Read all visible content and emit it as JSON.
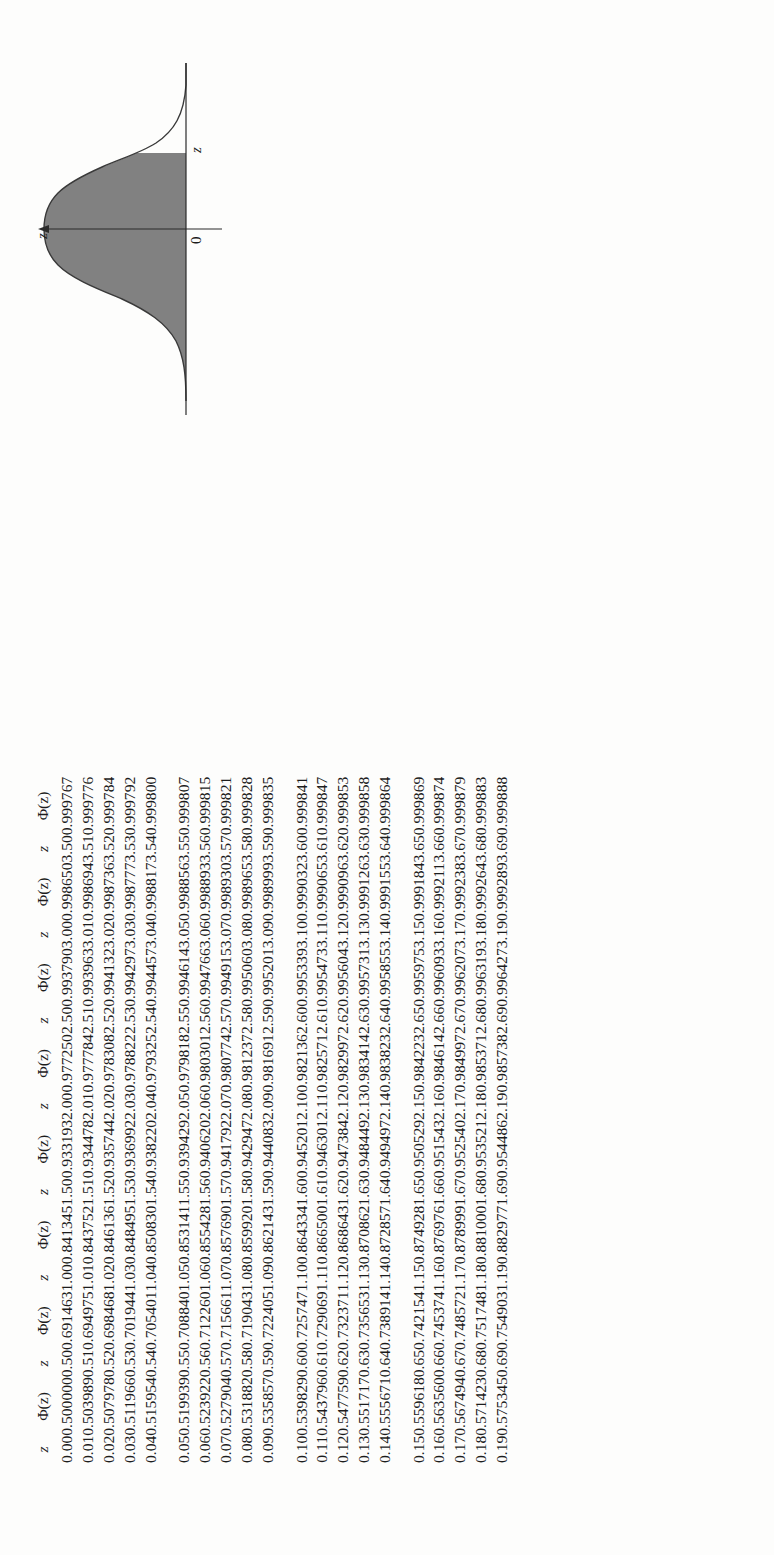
{
  "figure": {
    "name": "standard-normal-curve",
    "axis_label_top": "z",
    "origin_label": "0",
    "x_label": "z",
    "shade_color": "#7d7d7d",
    "curve_color": "#3a3a3a"
  },
  "table": {
    "headers": {
      "z": "z",
      "phi": "Φ(z)"
    },
    "group_count": 4,
    "rows_per_group": 5,
    "blocks": [
      {
        "start": "0.00",
        "z": [
          "0.00",
          "0.01",
          "0.02",
          "0.03",
          "0.04",
          "0.05",
          "0.06",
          "0.07",
          "0.08",
          "0.09",
          "0.10",
          "0.11",
          "0.12",
          "0.13",
          "0.14",
          "0.15",
          "0.16",
          "0.17",
          "0.18",
          "0.19"
        ],
        "phi": [
          "0.500000",
          "0.503989",
          "0.507978",
          "0.511966",
          "0.515954",
          "0.519939",
          "0.523922",
          "0.527904",
          "0.531882",
          "0.535857",
          "0.539829",
          "0.543796",
          "0.547759",
          "0.551717",
          "0.555671",
          "0.559618",
          "0.563560",
          "0.567494",
          "0.571423",
          "0.575345"
        ]
      },
      {
        "start": "0.50",
        "z": [
          "0.50",
          "0.51",
          "0.52",
          "0.53",
          "0.54",
          "0.55",
          "0.56",
          "0.57",
          "0.58",
          "0.59",
          "0.60",
          "0.61",
          "0.62",
          "0.63",
          "0.64",
          "0.65",
          "0.66",
          "0.67",
          "0.68",
          "0.69"
        ],
        "phi": [
          "0.691463",
          "0.694975",
          "0.698468",
          "0.701944",
          "0.705401",
          "0.708840",
          "0.712260",
          "0.715661",
          "0.719043",
          "0.722405",
          "0.725747",
          "0.729069",
          "0.732371",
          "0.735653",
          "0.738914",
          "0.742154",
          "0.745374",
          "0.748572",
          "0.751748",
          "0.754903"
        ]
      },
      {
        "start": "1.00",
        "z": [
          "1.00",
          "1.01",
          "1.02",
          "1.03",
          "1.04",
          "1.05",
          "1.06",
          "1.07",
          "1.08",
          "1.09",
          "1.10",
          "1.11",
          "1.12",
          "1.13",
          "1.14",
          "1.15",
          "1.16",
          "1.17",
          "1.18",
          "1.19"
        ],
        "phi": [
          "0.841345",
          "0.843752",
          "0.846136",
          "0.848495",
          "0.850830",
          "0.853141",
          "0.855428",
          "0.857690",
          "0.859920",
          "0.862143",
          "0.864334",
          "0.866500",
          "0.868643",
          "0.870862",
          "0.872857",
          "0.874928",
          "0.876976",
          "0.878999",
          "0.881000",
          "0.882977"
        ]
      },
      {
        "start": "1.50",
        "z": [
          "1.50",
          "1.51",
          "1.52",
          "1.53",
          "1.54",
          "1.55",
          "1.56",
          "1.57",
          "1.58",
          "1.59",
          "1.60",
          "1.61",
          "1.62",
          "1.63",
          "1.64",
          "1.65",
          "1.66",
          "1.67",
          "1.68",
          "1.69"
        ],
        "phi": [
          "0.933193",
          "0.934478",
          "0.935744",
          "0.936992",
          "0.938220",
          "0.939429",
          "0.940620",
          "0.941792",
          "0.942947",
          "0.944083",
          "0.945201",
          "0.946301",
          "0.947384",
          "0.948449",
          "0.949497",
          "0.950529",
          "0.951543",
          "0.952540",
          "0.953521",
          "0.954486"
        ]
      },
      {
        "start": "2.00",
        "z": [
          "2.00",
          "2.01",
          "2.02",
          "2.03",
          "2.04",
          "2.05",
          "2.06",
          "2.07",
          "2.08",
          "2.09",
          "2.10",
          "2.11",
          "2.12",
          "2.13",
          "2.14",
          "2.15",
          "2.16",
          "2.17",
          "2.18",
          "2.19"
        ],
        "phi": [
          "0.977250",
          "0.977784",
          "0.978308",
          "0.978822",
          "0.979325",
          "0.979818",
          "0.980301",
          "0.980774",
          "0.981237",
          "0.981691",
          "0.982136",
          "0.982571",
          "0.982997",
          "0.983414",
          "0.983823",
          "0.984223",
          "0.984614",
          "0.984997",
          "0.985371",
          "0.985738"
        ]
      },
      {
        "start": "2.50",
        "z": [
          "2.50",
          "2.51",
          "2.52",
          "2.53",
          "2.54",
          "2.55",
          "2.56",
          "2.57",
          "2.58",
          "2.59",
          "2.60",
          "2.61",
          "2.62",
          "2.63",
          "2.64",
          "2.65",
          "2.66",
          "2.67",
          "2.68",
          "2.69"
        ],
        "phi": [
          "0.993790",
          "0.993963",
          "0.994132",
          "0.994297",
          "0.994457",
          "0.994614",
          "0.994766",
          "0.994915",
          "0.995060",
          "0.995201",
          "0.995339",
          "0.995473",
          "0.995604",
          "0.995731",
          "0.995855",
          "0.995975",
          "0.996093",
          "0.996207",
          "0.996319",
          "0.996427"
        ]
      },
      {
        "start": "3.00",
        "z": [
          "3.00",
          "3.01",
          "3.02",
          "3.03",
          "3.04",
          "3.05",
          "3.06",
          "3.07",
          "3.08",
          "3.09",
          "3.10",
          "3.11",
          "3.12",
          "3.13",
          "3.14",
          "3.15",
          "3.16",
          "3.17",
          "3.18",
          "3.19"
        ],
        "phi": [
          "0.998650",
          "0.998694",
          "0.998736",
          "0.998777",
          "0.998817",
          "0.998856",
          "0.998893",
          "0.998930",
          "0.998965",
          "0.998999",
          "0.999032",
          "0.999065",
          "0.999096",
          "0.999126",
          "0.999155",
          "0.999184",
          "0.999211",
          "0.999238",
          "0.999264",
          "0.999289"
        ]
      },
      {
        "start": "3.50",
        "z": [
          "3.50",
          "3.51",
          "3.52",
          "3.53",
          "3.54",
          "3.55",
          "3.56",
          "3.57",
          "3.58",
          "3.59",
          "3.60",
          "3.61",
          "3.62",
          "3.63",
          "3.64",
          "3.65",
          "3.66",
          "3.67",
          "3.68",
          "3.69"
        ],
        "phi": [
          "0.999767",
          "0.999776",
          "0.999784",
          "0.999792",
          "0.999800",
          "0.999807",
          "0.999815",
          "0.999821",
          "0.999828",
          "0.999835",
          "0.999841",
          "0.999847",
          "0.999853",
          "0.999858",
          "0.999864",
          "0.999869",
          "0.999874",
          "0.999879",
          "0.999883",
          "0.999888"
        ]
      }
    ]
  },
  "chart_data": {
    "type": "line",
    "title": "",
    "xlabel": "z",
    "ylabel": "",
    "annotations": [
      "z",
      "0",
      "z"
    ],
    "x": [
      -3.4,
      -3.0,
      -2.6,
      -2.2,
      -1.8,
      -1.4,
      -1.0,
      -0.6,
      -0.2,
      0.2,
      0.6,
      1.0,
      1.4,
      1.8,
      2.2,
      2.6,
      3.0,
      3.4
    ],
    "values": [
      0.0012,
      0.0044,
      0.0136,
      0.0355,
      0.079,
      0.1497,
      0.242,
      0.3332,
      0.391,
      0.391,
      0.3332,
      0.242,
      0.1497,
      0.079,
      0.0355,
      0.0136,
      0.0044,
      0.0012
    ],
    "shaded_region": [
      -3.4,
      1.1
    ],
    "grid": false,
    "legend": "none"
  }
}
